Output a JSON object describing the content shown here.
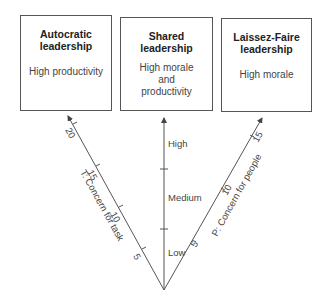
{
  "boxes": [
    {
      "title": "Autocratic\nleadership",
      "desc": "High productivity"
    },
    {
      "title": "Shared\nleadership",
      "desc": "High morale\nand\nproductivity"
    },
    {
      "title": "Laissez-Faire\nleadership",
      "desc": "High morale"
    }
  ],
  "axes": {
    "task": {
      "label": "T: Concern for task",
      "ticks": [
        "5",
        "10",
        "15",
        "20"
      ]
    },
    "middle": {
      "levels": [
        "Low",
        "Medium",
        "High"
      ]
    },
    "people": {
      "label": "P: Concern for people",
      "ticks": [
        "5",
        "10",
        "15"
      ]
    }
  }
}
